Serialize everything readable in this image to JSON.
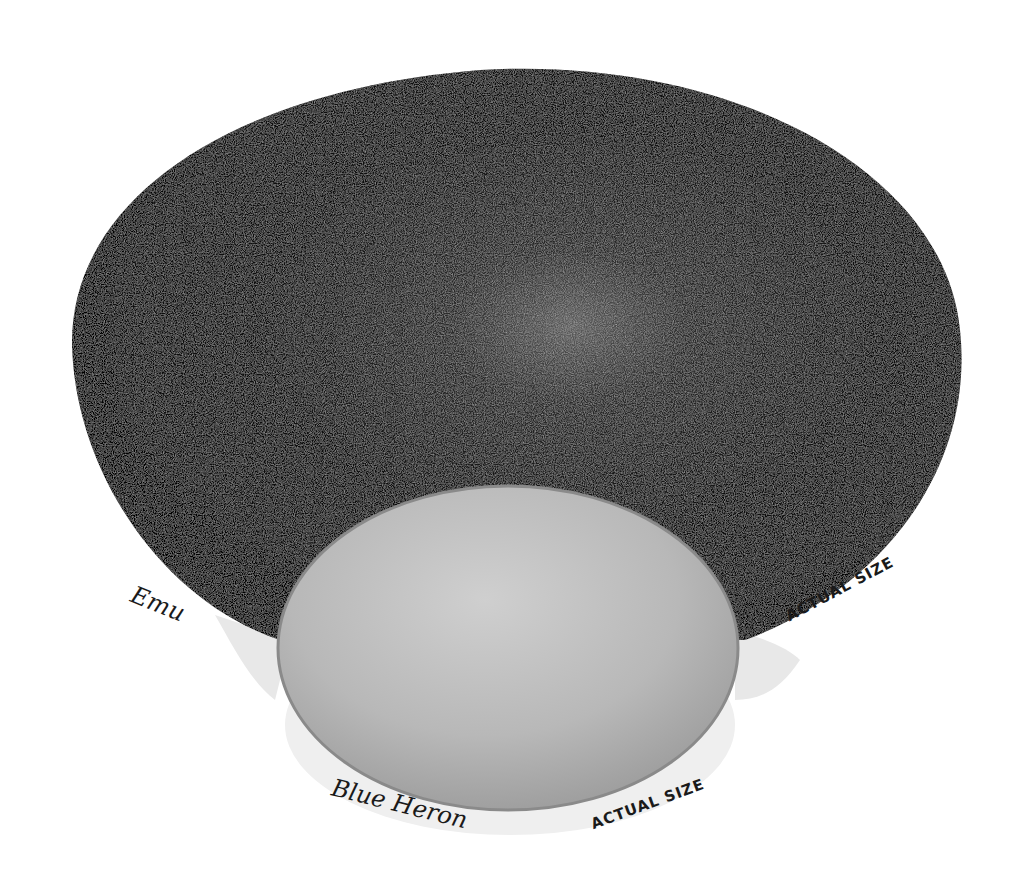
{
  "illustration": {
    "subject": "Egg size comparison drawing",
    "background_color": "#ffffff",
    "eggs": [
      {
        "name": "emu-egg",
        "label": "Emu",
        "size_note": "ACTUAL SIZE",
        "color": "#0c0c0c",
        "highlight_color": "#6a6a6a"
      },
      {
        "name": "blue-heron-egg",
        "label": "Blue Heron",
        "size_note": "ACTUAL SIZE",
        "color": "#b4b4b4",
        "edge_color": "#8a8a8a"
      }
    ],
    "shadow_color": "#e6e6e6"
  }
}
